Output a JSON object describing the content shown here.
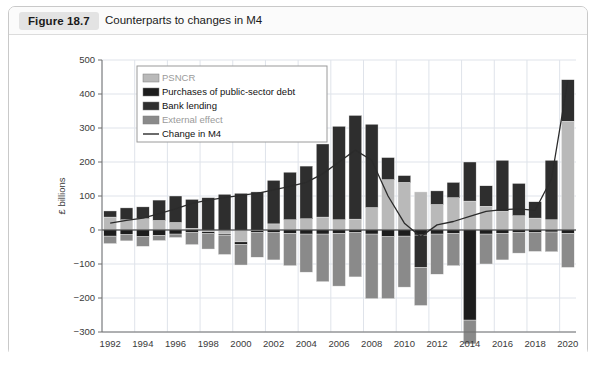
{
  "figure": {
    "number_label": "Figure 18.7",
    "caption": "Counterparts to changes in M4"
  },
  "colors": {
    "psncr": "#b9b9b9",
    "purchases": "#1d1d1d",
    "bank_lending": "#2e2e2e",
    "external": "#8a8a8a",
    "change_line": "#2b2b2b",
    "grid": "#dfe3ea",
    "axis": "#6e6e6e",
    "panel_bg": "#ffffff",
    "header_bg": "#fbfbfb",
    "badge_bg": "#e3e3e3"
  },
  "chart_data": {
    "type": "bar",
    "title": "Counterparts to changes in M4",
    "subtitle": "",
    "xlabel": "",
    "ylabel": "£ billions",
    "ylim": [
      -300,
      500
    ],
    "ytick_step": 100,
    "ytick_labels": [
      "500",
      "400",
      "300",
      "200",
      "100",
      "0",
      "−100",
      "−200",
      "−300"
    ],
    "ytick_values": [
      500,
      400,
      300,
      200,
      100,
      0,
      -100,
      -200,
      -300
    ],
    "grid": true,
    "legend_position": "top-left",
    "stacked": true,
    "x": [
      1992,
      1993,
      1994,
      1995,
      1996,
      1997,
      1998,
      1999,
      2000,
      2001,
      2002,
      2003,
      2004,
      2005,
      2006,
      2007,
      2008,
      2009,
      2010,
      2011,
      2012,
      2013,
      2014,
      2015,
      2016,
      2017,
      2018,
      2019,
      2020
    ],
    "xtick_labels": [
      "1992",
      "1994",
      "1996",
      "1998",
      "2000",
      "2002",
      "2004",
      "2006",
      "2008",
      "2010",
      "2012",
      "2014",
      "2016",
      "2018",
      "2020"
    ],
    "xtick_values": [
      1992,
      1994,
      1996,
      1998,
      2000,
      2002,
      2004,
      2006,
      2008,
      2010,
      2012,
      2014,
      2016,
      2018,
      2020
    ],
    "series": [
      {
        "name": "PSNCR",
        "color": "#b9b9b9",
        "values": [
          38,
          30,
          33,
          28,
          22,
          5,
          -5,
          -12,
          -35,
          -2,
          18,
          30,
          33,
          38,
          30,
          32,
          66,
          148,
          140,
          112,
          75,
          95,
          85,
          70,
          55,
          42,
          35,
          30,
          320
        ]
      },
      {
        "name": "Purchases of public-sector debt",
        "color": "#1d1d1d",
        "values": [
          -18,
          -14,
          -20,
          -16,
          -12,
          -8,
          -6,
          -5,
          -8,
          -6,
          -8,
          -10,
          -12,
          -12,
          -10,
          -8,
          -12,
          -20,
          -18,
          -15,
          -12,
          -10,
          -265,
          -12,
          -10,
          -8,
          -8,
          -6,
          -10
        ]
      },
      {
        "name": "Bank lending",
        "color": "#2e2e2e",
        "values": [
          18,
          35,
          35,
          60,
          78,
          85,
          95,
          105,
          108,
          112,
          128,
          140,
          155,
          215,
          275,
          305,
          245,
          65,
          20,
          -95,
          40,
          45,
          115,
          60,
          150,
          95,
          48,
          175,
          122
        ]
      },
      {
        "name": "External effect",
        "color": "#8a8a8a",
        "values": [
          -22,
          -18,
          -28,
          -15,
          -10,
          -35,
          -45,
          -55,
          -60,
          -72,
          -80,
          -95,
          -112,
          -140,
          -155,
          -130,
          -190,
          -182,
          -150,
          -112,
          -118,
          -95,
          -70,
          -88,
          -78,
          -60,
          -55,
          -58,
          -100
        ]
      }
    ],
    "line_series": {
      "name": "Change in M4",
      "color": "#2b2b2b",
      "values": [
        20,
        28,
        35,
        48,
        62,
        78,
        88,
        95,
        102,
        108,
        118,
        128,
        140,
        165,
        200,
        235,
        205,
        100,
        20,
        -20,
        15,
        25,
        40,
        55,
        60,
        62,
        58,
        150,
        440
      ]
    },
    "legend": [
      {
        "label": "PSNCR",
        "marker": "swatch",
        "color": "#b9b9b9"
      },
      {
        "label": "Purchases of public-sector debt",
        "marker": "swatch",
        "color": "#1d1d1d"
      },
      {
        "label": "Bank lending",
        "marker": "swatch",
        "color": "#2e2e2e"
      },
      {
        "label": "External effect",
        "marker": "swatch",
        "color": "#8a8a8a"
      },
      {
        "label": "Change in M4",
        "marker": "line",
        "color": "#2b2b2b"
      }
    ]
  }
}
